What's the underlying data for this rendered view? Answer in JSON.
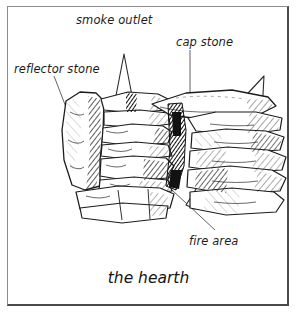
{
  "figure": {
    "caption": "the hearth",
    "background_color": "#ffffff",
    "ink_color": "#1c1c1c",
    "frame": {
      "border_light_color": "#8d8d8d",
      "border_dark_color": "#4a4a4a"
    },
    "labels": [
      {
        "id": "smoke-outlet",
        "text": "smoke outlet"
      },
      {
        "id": "cap-stone",
        "text": "cap stone"
      },
      {
        "id": "reflector-stone",
        "text": "reflector stone"
      },
      {
        "id": "fire-area",
        "text": "fire area"
      }
    ],
    "callouts": {
      "smoke_outlet": "smoke outlet",
      "cap_stone": "cap stone",
      "reflector_stone": "reflector stone",
      "fire_area": "fire area"
    },
    "illustration": {
      "subject": "stone hearth / fire pit built of stacked flat stones",
      "style": "pen-and-ink line drawing with cross-hatch shading",
      "arrows": [
        {
          "id": "smoke-arrow-vertical",
          "direction": "up",
          "style": "hollow outline"
        },
        {
          "id": "smoke-arrow-diagonal",
          "direction": "up-right",
          "style": "hollow outline"
        }
      ],
      "parts": [
        "reflector stone",
        "cap stone",
        "fire area",
        "smoke outlet",
        "hearth floor slab"
      ]
    }
  }
}
